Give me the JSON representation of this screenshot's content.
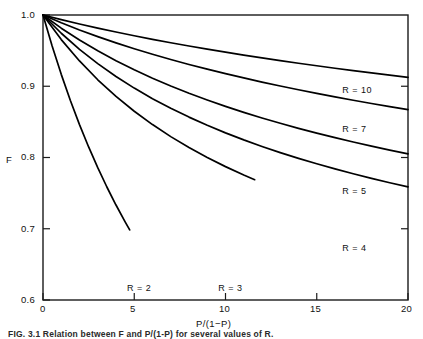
{
  "figure": {
    "caption": "FIG. 3.1  Relation between F and P/(1-P) for several values of R."
  },
  "chart_data": {
    "type": "line",
    "title": "",
    "xlabel": "P/(1−P)",
    "ylabel": "F",
    "xlim": [
      0,
      20
    ],
    "ylim": [
      0.6,
      1.0
    ],
    "xticks": [
      0,
      5,
      10,
      15,
      20
    ],
    "xticklabels": [
      "0",
      "5",
      "10",
      "15",
      "20"
    ],
    "yticks": [
      0.6,
      0.7,
      0.8,
      0.9,
      1.0
    ],
    "yticklabels": [
      "0.6",
      "0.7",
      "0.8",
      "0.9",
      "1.0"
    ],
    "grid": false,
    "legend": "inline-curve-labels",
    "series": [
      {
        "name": "R = 10",
        "label": "R = 10",
        "label_x": 16.4,
        "label_y": 0.893,
        "x": [
          0,
          1,
          2,
          3,
          4,
          5,
          6,
          7,
          8,
          9,
          10,
          11,
          12,
          13,
          14,
          15,
          16,
          17,
          18,
          19,
          20
        ],
        "y": [
          1.0,
          0.9935,
          0.9874,
          0.9816,
          0.9761,
          0.9709,
          0.9659,
          0.9611,
          0.9565,
          0.9521,
          0.9479,
          0.9438,
          0.9398,
          0.936,
          0.9323,
          0.9288,
          0.9253,
          0.9219,
          0.9187,
          0.9155,
          0.9124
        ]
      },
      {
        "name": "R = 7",
        "label": "R = 7",
        "label_x": 16.4,
        "label_y": 0.838,
        "x": [
          0,
          1,
          2,
          3,
          4,
          5,
          6,
          7,
          8,
          9,
          10,
          11,
          12,
          13,
          14,
          15,
          16,
          17,
          18,
          19,
          20
        ],
        "y": [
          1.0,
          0.9891,
          0.979,
          0.9697,
          0.9609,
          0.9527,
          0.9449,
          0.9376,
          0.9306,
          0.924,
          0.9177,
          0.9117,
          0.9059,
          0.9004,
          0.8951,
          0.89,
          0.8851,
          0.8804,
          0.8758,
          0.8714,
          0.8672
        ]
      },
      {
        "name": "R = 5",
        "label": "R = 5",
        "label_x": 16.4,
        "label_y": 0.752,
        "x": [
          0,
          1,
          2,
          3,
          4,
          5,
          6,
          7,
          8,
          9,
          10,
          11,
          12,
          13,
          14,
          15,
          16,
          17,
          18,
          19,
          20
        ],
        "y": [
          1.0,
          0.9815,
          0.9648,
          0.9497,
          0.9358,
          0.9231,
          0.9113,
          0.9004,
          0.8902,
          0.8807,
          0.8718,
          0.8634,
          0.8555,
          0.848,
          0.8409,
          0.8342,
          0.8278,
          0.8217,
          0.8159,
          0.8103,
          0.805
        ]
      },
      {
        "name": "R = 4",
        "label": "R = 4",
        "label_x": 16.4,
        "label_y": 0.672,
        "x": [
          0,
          1,
          2,
          3,
          4,
          5,
          6,
          7,
          8,
          9,
          10,
          11,
          12,
          13,
          14,
          15,
          16,
          17,
          18,
          19,
          20
        ],
        "y": [
          1.0,
          0.9744,
          0.9518,
          0.9317,
          0.9137,
          0.8974,
          0.8826,
          0.8691,
          0.8567,
          0.8452,
          0.8346,
          0.8247,
          0.8155,
          0.8069,
          0.7988,
          0.7912,
          0.784,
          0.7772,
          0.7707,
          0.7646,
          0.7588
        ]
      },
      {
        "name": "R = 3",
        "label": "R = 3",
        "label_x": 9.6,
        "label_y": 0.616,
        "x": [
          0,
          1,
          2,
          3,
          4,
          5,
          6,
          7,
          8,
          9,
          10,
          11,
          11.6
        ],
        "y": [
          1.0,
          0.9655,
          0.9355,
          0.9091,
          0.8857,
          0.8649,
          0.8462,
          0.8293,
          0.814,
          0.8,
          0.7872,
          0.7755,
          0.7689
        ]
      },
      {
        "name": "R = 2",
        "label": "R = 2",
        "label_x": 4.6,
        "label_y": 0.616,
        "x": [
          0,
          0.5,
          1,
          1.5,
          2,
          2.5,
          3,
          3.5,
          4,
          4.5,
          4.75
        ],
        "y": [
          1.0,
          0.9565,
          0.9167,
          0.88,
          0.8462,
          0.8148,
          0.7857,
          0.7586,
          0.7333,
          0.7097,
          0.6984
        ]
      }
    ]
  },
  "axes": {
    "frame_color": "#1b1b1b",
    "curve_color": "#000000"
  }
}
